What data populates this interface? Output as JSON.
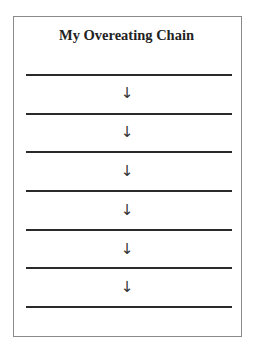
{
  "document": {
    "title": "My Overeating Chain",
    "chain": {
      "blank_lines": 7,
      "arrow_glyph": "↓",
      "arrows": [
        "↓",
        "↓",
        "↓",
        "↓",
        "↓",
        "↓"
      ]
    }
  }
}
